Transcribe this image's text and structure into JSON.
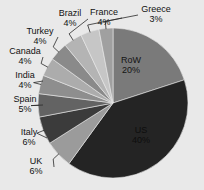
{
  "chart_data": {
    "type": "pie",
    "title": "",
    "subtitle": "",
    "xlabel": "",
    "ylabel": "",
    "legend_position": "none",
    "grid": false,
    "labels_show_percent": true,
    "start_angle_deg": 0,
    "direction": "clockwise",
    "categories": [
      "RoW",
      "US",
      "UK",
      "Italy",
      "Spain",
      "India",
      "Canada",
      "Turkey",
      "Brazil",
      "France",
      "Greece"
    ],
    "values": [
      20,
      40,
      6,
      6,
      5,
      4,
      4,
      4,
      4,
      4,
      3
    ],
    "value_unit": "%",
    "slices": [
      {
        "label": "RoW",
        "value": 20,
        "value_text": "20%",
        "color": "#7a7a7a",
        "label_placement": "inside",
        "label_x": 131,
        "label_y": 61,
        "pct_x": 131,
        "pct_y": 71,
        "text_color": "#141414"
      },
      {
        "label": "US",
        "value": 40,
        "value_text": "40%",
        "color": "#242424",
        "label_placement": "inside",
        "label_x": 141,
        "label_y": 131,
        "pct_x": 141,
        "pct_y": 141,
        "text_color": "#0d0d0d"
      },
      {
        "label": "UK",
        "value": 6,
        "value_text": "6%",
        "color": "#9b9b9b",
        "label_placement": "outside",
        "label_x": 36,
        "label_y": 162,
        "pct_x": 36,
        "pct_y": 172,
        "text_color": "#111111"
      },
      {
        "label": "Italy",
        "value": 6,
        "value_text": "6%",
        "color": "#3b3b3b",
        "label_placement": "outside",
        "label_x": 29,
        "label_y": 133,
        "pct_x": 29,
        "pct_y": 143,
        "text_color": "#111111"
      },
      {
        "label": "Spain",
        "value": 5,
        "value_text": "5%",
        "color": "#636363",
        "label_placement": "outside",
        "label_x": 25,
        "label_y": 100,
        "pct_x": 25,
        "pct_y": 110,
        "text_color": "#111111"
      },
      {
        "label": "India",
        "value": 4,
        "value_text": "4%",
        "color": "#8e8e8e",
        "label_placement": "outside",
        "label_x": 25,
        "label_y": 76,
        "pct_x": 25,
        "pct_y": 86,
        "text_color": "#111111"
      },
      {
        "label": "Canada",
        "value": 4,
        "value_text": "4%",
        "color": "#acacac",
        "label_placement": "outside",
        "label_x": 25,
        "label_y": 52,
        "pct_x": 25,
        "pct_y": 62,
        "text_color": "#111111"
      },
      {
        "label": "Turkey",
        "value": 4,
        "value_text": "4%",
        "color": "#8a8a8a",
        "label_placement": "outside",
        "label_x": 40,
        "label_y": 32,
        "pct_x": 40,
        "pct_y": 42,
        "text_color": "#111111"
      },
      {
        "label": "Brazil",
        "value": 4,
        "value_text": "4%",
        "color": "#b4b4b4",
        "label_placement": "outside",
        "label_x": 70,
        "label_y": 14,
        "pct_x": 70,
        "pct_y": 24,
        "text_color": "#111111"
      },
      {
        "label": "France",
        "value": 4,
        "value_text": "4%",
        "color": "#c6c6c6",
        "label_placement": "outside",
        "label_x": 104,
        "label_y": 13,
        "pct_x": 104,
        "pct_y": 23,
        "text_color": "#111111"
      },
      {
        "label": "Greece",
        "value": 3,
        "value_text": "3%",
        "color": "#a0a0a0",
        "label_placement": "outside",
        "label_x": 156,
        "label_y": 10,
        "pct_x": 156,
        "pct_y": 20,
        "text_color": "#111111"
      }
    ],
    "geometry": {
      "cx": 113,
      "cy": 103,
      "r": 75
    },
    "background_color": "#e9e9e9"
  }
}
